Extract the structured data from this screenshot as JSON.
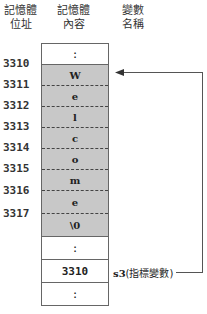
{
  "headers": {
    "address": [
      "記憶體",
      "位址"
    ],
    "content": [
      "記憶體",
      "內容"
    ],
    "variable": [
      "變數",
      "名稱"
    ]
  },
  "memory": {
    "cells": [
      {
        "value": ":",
        "shaded": false
      },
      {
        "value": "W",
        "shaded": true
      },
      {
        "value": "e",
        "shaded": true
      },
      {
        "value": "l",
        "shaded": true
      },
      {
        "value": "c",
        "shaded": true
      },
      {
        "value": "o",
        "shaded": true
      },
      {
        "value": "m",
        "shaded": true
      },
      {
        "value": "e",
        "shaded": true
      },
      {
        "value": "\\0",
        "shaded": true
      },
      {
        "value": ":",
        "shaded": false
      },
      {
        "value": "3310",
        "shaded": false
      },
      {
        "value": ":",
        "shaded": false
      }
    ],
    "addresses": [
      "3310",
      "3311",
      "3312",
      "3313",
      "3314",
      "3315",
      "3316",
      "3317"
    ]
  },
  "pointer": {
    "name": "s3",
    "description": "(指標變數)",
    "points_to": "3310",
    "arrow_color": "#555555"
  }
}
